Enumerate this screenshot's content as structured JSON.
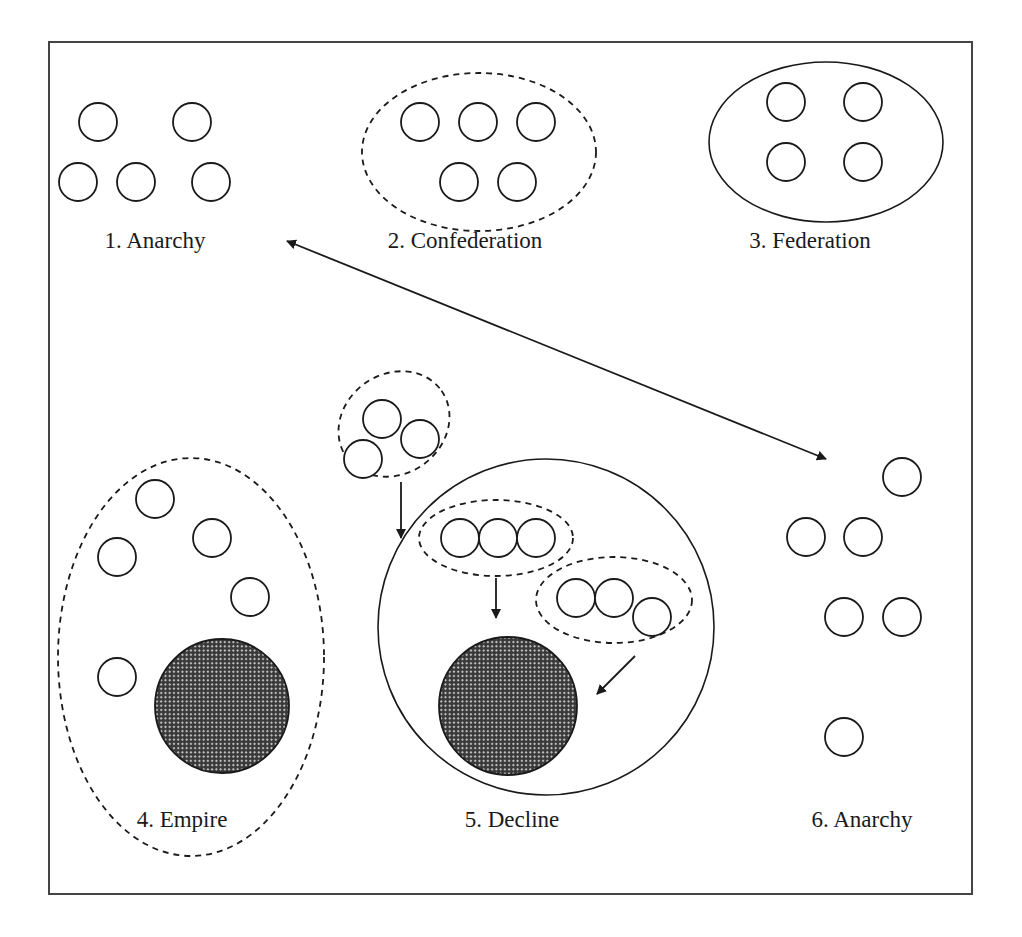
{
  "diagram": {
    "frame": {
      "x": 49,
      "y": 42,
      "w": 923,
      "h": 852
    },
    "colors": {
      "stroke": "#1a1a1a",
      "background": "#ffffff",
      "hatch_dark": "#3a3a3a",
      "hatch_light": "#bdbdbd"
    },
    "stages": [
      {
        "id": "anarchy-1",
        "label": "1. Anarchy",
        "label_pos": [
          155,
          248
        ],
        "container": null,
        "units": [
          [
            98,
            122
          ],
          [
            192,
            122
          ],
          [
            78,
            182
          ],
          [
            136,
            182
          ],
          [
            211,
            182
          ]
        ],
        "dominant": []
      },
      {
        "id": "confederation",
        "label": "2. Confederation",
        "label_pos": [
          465,
          248
        ],
        "container": {
          "type": "dashed",
          "cx": 479,
          "cy": 152,
          "rx": 117,
          "ry": 79,
          "rot": 0
        },
        "units": [
          [
            420,
            122
          ],
          [
            478,
            122
          ],
          [
            536,
            122
          ],
          [
            459,
            182
          ],
          [
            517,
            182
          ]
        ],
        "dominant": []
      },
      {
        "id": "federation",
        "label": "3. Federation",
        "label_pos": [
          810,
          248
        ],
        "container": {
          "type": "solid",
          "cx": 826,
          "cy": 142,
          "rx": 117,
          "ry": 80,
          "rot": 0
        },
        "units": [
          [
            786,
            102
          ],
          [
            863,
            102
          ],
          [
            786,
            162
          ],
          [
            863,
            162
          ]
        ],
        "dominant": []
      },
      {
        "id": "empire",
        "label": "4. Empire",
        "label_pos": [
          182,
          827
        ],
        "container": {
          "type": "dashed",
          "cx": 191,
          "cy": 657,
          "rx": 133,
          "ry": 199,
          "rot": 0
        },
        "units": [
          [
            155,
            499
          ],
          [
            117,
            557
          ],
          [
            212,
            538
          ],
          [
            250,
            597
          ],
          [
            117,
            677
          ]
        ],
        "dominant": [
          {
            "cx": 222,
            "cy": 706,
            "r": 67
          }
        ]
      },
      {
        "id": "decline",
        "label": "5. Decline",
        "label_pos": [
          512,
          827
        ],
        "container": {
          "type": "solid-circle",
          "cx": 546,
          "cy": 627,
          "r": 168
        },
        "subgroups": [
          {
            "cx": 394,
            "cy": 424,
            "rx": 58,
            "ry": 50,
            "rot": -35,
            "units": [
              [
                382,
                419
              ],
              [
                420,
                439
              ],
              [
                363,
                459
              ]
            ]
          },
          {
            "cx": 496,
            "cy": 538,
            "rx": 77,
            "ry": 38,
            "rot": 0,
            "units": [
              [
                460,
                538
              ],
              [
                498,
                538
              ],
              [
                536,
                538
              ]
            ]
          },
          {
            "cx": 614,
            "cy": 600,
            "rx": 78,
            "ry": 43,
            "rot": 0,
            "units": [
              [
                576,
                598
              ],
              [
                614,
                598
              ],
              [
                652,
                617
              ]
            ]
          }
        ],
        "units": [],
        "dominant": [
          {
            "cx": 508,
            "cy": 706,
            "r": 69
          }
        ]
      },
      {
        "id": "anarchy-6",
        "label": "6. Anarchy",
        "label_pos": [
          862,
          827
        ],
        "container": null,
        "units": [
          [
            902,
            477
          ],
          [
            806,
            537
          ],
          [
            863,
            537
          ],
          [
            844,
            617
          ],
          [
            902,
            617
          ],
          [
            844,
            737
          ]
        ],
        "dominant": []
      }
    ],
    "unit_radius": 19,
    "arrows": [
      {
        "id": "cycle-arrow",
        "from": [
          287,
          241
        ],
        "to": [
          826,
          459
        ],
        "double": true
      },
      {
        "id": "secession-arrow-1",
        "from": [
          401,
          482
        ],
        "to": [
          401,
          538
        ],
        "double": false
      },
      {
        "id": "secession-arrow-2",
        "from": [
          496,
          578
        ],
        "to": [
          496,
          618
        ],
        "double": false
      },
      {
        "id": "secession-arrow-3",
        "from": [
          635,
          656
        ],
        "to": [
          597,
          694
        ],
        "double": false
      }
    ]
  }
}
